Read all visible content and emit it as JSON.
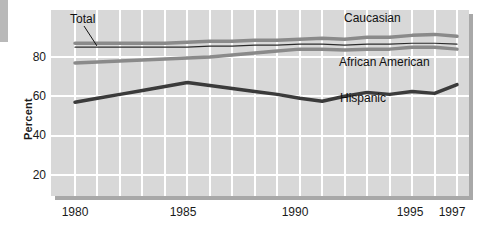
{
  "chart_data": {
    "type": "line",
    "title": "",
    "xlabel": "",
    "ylabel": "Percent",
    "xlim": [
      1980,
      1997
    ],
    "ylim": [
      0,
      100
    ],
    "xticks": [
      1980,
      1985,
      1990,
      1995,
      1997
    ],
    "xtick_labels": [
      "1980",
      "1985",
      "1990",
      "1995",
      "1997"
    ],
    "yticks": [
      20,
      40,
      60,
      80
    ],
    "ytick_labels": [
      "20",
      "40",
      "60",
      "80"
    ],
    "grid": "both-white-on-gray",
    "legend_position": "inline-annotations",
    "x": [
      1980,
      1981,
      1982,
      1983,
      1984,
      1985,
      1986,
      1987,
      1988,
      1989,
      1990,
      1991,
      1992,
      1993,
      1994,
      1995,
      1996,
      1997
    ],
    "series": [
      {
        "name": "Caucasian",
        "color": "#8a8a8a",
        "width": 3.5,
        "values": [
          87,
          87,
          87,
          87,
          87,
          87.5,
          88,
          88,
          88.5,
          88.5,
          89,
          89.5,
          89,
          90,
          90,
          91,
          91.5,
          90.5
        ]
      },
      {
        "name": "Total",
        "color": "#2b2b2b",
        "width": 1.2,
        "values": [
          85,
          85,
          85,
          85,
          85,
          85,
          85.5,
          85.5,
          86,
          86,
          86.5,
          86.5,
          86,
          86.5,
          86.5,
          87,
          87,
          86.5
        ]
      },
      {
        "name": "African American",
        "color": "#8a8a8a",
        "width": 3.5,
        "values": [
          77,
          77.5,
          78,
          78.5,
          79,
          79.5,
          80,
          81,
          82,
          83,
          84,
          84,
          83.5,
          84,
          84,
          85,
          85,
          84
        ]
      },
      {
        "name": "Hispanic",
        "color": "#3b3b3b",
        "width": 3.5,
        "values": [
          57,
          59,
          61,
          63,
          65,
          67,
          65.5,
          64,
          62.5,
          61,
          59,
          57.5,
          60,
          62,
          61,
          62.5,
          61.5,
          66
        ]
      }
    ],
    "annotations": [
      {
        "text": "Total",
        "series": "Total"
      },
      {
        "text": "Caucasian",
        "series": "Caucasian"
      },
      {
        "text": "African American",
        "series": "African American"
      },
      {
        "text": "Hispanic",
        "series": "Hispanic"
      }
    ]
  },
  "axis": {
    "y_title": "Percent",
    "y_ticks": [
      "80",
      "60",
      "40",
      "20"
    ],
    "x_ticks": [
      "1980",
      "1985",
      "1990",
      "1995",
      "1997"
    ]
  },
  "colors": {
    "plot_background": "#d8d8d8",
    "gridline": "#ffffff",
    "shadow": "#a8a8a8",
    "gray_series": "#8a8a8a",
    "dark_series": "#3b3b3b",
    "thin_series": "#2b2b2b",
    "text": "#1a1a1a"
  }
}
